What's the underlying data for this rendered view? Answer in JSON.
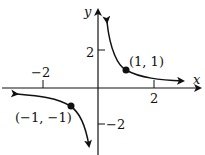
{
  "figure": {
    "function": "y = 1/x",
    "axes": {
      "x_label": "x",
      "y_label": "y"
    },
    "x_ticks": [
      {
        "value": -2,
        "label": "−2"
      },
      {
        "value": 2,
        "label": "2"
      }
    ],
    "y_ticks": [
      {
        "value": 2,
        "label": "2"
      },
      {
        "value": -2,
        "label": "−2"
      }
    ],
    "points": [
      {
        "x": 1,
        "y": 1,
        "label": "(1, 1)"
      },
      {
        "x": -1,
        "y": -1,
        "label": "(−1, −1)"
      }
    ],
    "colors": {
      "ink": "#111111",
      "background": "#ffffff"
    }
  }
}
